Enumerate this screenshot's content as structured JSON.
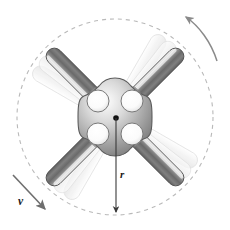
{
  "figure": {
    "background_color": "#ffffff",
    "width": 230,
    "height": 230,
    "center": {
      "x": 115,
      "y": 117
    }
  },
  "labels": {
    "radius": "r",
    "velocity": "v"
  },
  "path": {
    "name": "circular-path",
    "style": "dashed",
    "color": "#b9b9b9",
    "center_x": 115,
    "center_y": 117,
    "radius": 98,
    "dash": "4 4"
  },
  "radius_indicator": {
    "from_x": 116,
    "from_y": 118,
    "to_x": 116,
    "to_y": 215,
    "color": "#3a3a3a",
    "label": "r",
    "label_x": 120,
    "label_y": 176,
    "arrowhead": "down"
  },
  "velocity_vector": {
    "from_x": 13,
    "from_y": 175,
    "to_x": 48,
    "to_y": 212,
    "color": "#6e6e6e",
    "label": "v",
    "label_x": 22,
    "label_y": 203,
    "arrowhead": "down-right",
    "direction_degrees": 46
  },
  "rotation_arrow": {
    "name": "rotation-direction-arrow",
    "color": "#8a8a8a",
    "direction": "counterclockwise",
    "arrowhead_x": 183,
    "arrowhead_y": 16,
    "tail_x": 218,
    "tail_y": 62
  },
  "hub": {
    "name": "central-hub",
    "fill_light": "#f2f2f2",
    "fill_mid": "#b5b5b5",
    "fill_dark": "#7d7d7d",
    "outline": "#5c5c5c",
    "holes": 4,
    "hole_radius": 11,
    "center_dot_color": "#111111",
    "center_dot_radius": 3
  },
  "arms": [
    {
      "name": "arm-upper-left",
      "angle_degrees": 225,
      "length": 92,
      "blur_offset_degrees": 16
    },
    {
      "name": "arm-upper-right",
      "angle_degrees": 315,
      "length": 92,
      "blur_offset_degrees": 16
    },
    {
      "name": "arm-lower-right",
      "angle_degrees": 45,
      "length": 92,
      "blur_offset_degrees": 16
    },
    {
      "name": "arm-lower-left",
      "angle_degrees": 135,
      "length": 92,
      "blur_offset_degrees": 16
    }
  ],
  "colors": {
    "rod_dark": "#6d6d6d",
    "rod_mid": "#9c9c9c",
    "rod_light": "#e8e8e8",
    "rod_outline": "#4f4f4f",
    "collar_light": "#f5f5f5",
    "collar_shadow": "#c6c6c6",
    "ghost": "#efefef",
    "ghost_edge": "#dcdcdc",
    "dashed_circle": "#b9b9b9",
    "label_text": "#1a1a1a"
  }
}
